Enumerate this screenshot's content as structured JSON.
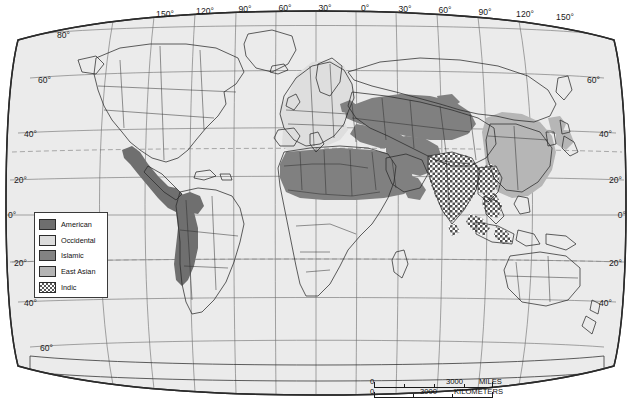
{
  "map": {
    "title": "World civilizations map",
    "projection": "Robinson",
    "background_color": "#ffffff",
    "ocean_color": "#ebebeb",
    "land_color": "#ffffff",
    "border_color": "#2b2b2b",
    "graticule_color": "#6b6b6b",
    "tropic_line_color": "#8c8c8c"
  },
  "graticule": {
    "longitude_labels": [
      "150°",
      "120°",
      "90°",
      "60°",
      "30°",
      "0°",
      "30°",
      "60°",
      "90°",
      "120°",
      "150°"
    ],
    "latitude_labels_left": [
      "80°",
      "60°",
      "40°",
      "20°",
      "0°",
      "20°",
      "40°",
      "60°"
    ],
    "latitude_labels_right": [
      "60°",
      "40°",
      "20°",
      "0°",
      "20°",
      "40°"
    ]
  },
  "legend": {
    "items": [
      {
        "label": "American",
        "swatch": "sw-american",
        "color": "#6e6e6e"
      },
      {
        "label": "Occidental",
        "swatch": "sw-occidental",
        "color": "#dcdcdc"
      },
      {
        "label": "Islamic",
        "swatch": "sw-islamic",
        "color": "#838383"
      },
      {
        "label": "East Asian",
        "swatch": "sw-eastasian",
        "color": "#b4b4b4"
      },
      {
        "label": "Indic",
        "swatch": "sw-indic",
        "color": "#5a5a5a"
      }
    ]
  },
  "scale_bar": {
    "miles": {
      "zero": "0",
      "value": "3000",
      "unit": "MILES"
    },
    "kilometers": {
      "zero": "0",
      "value": "3000",
      "unit": "KILOMETERS"
    }
  }
}
